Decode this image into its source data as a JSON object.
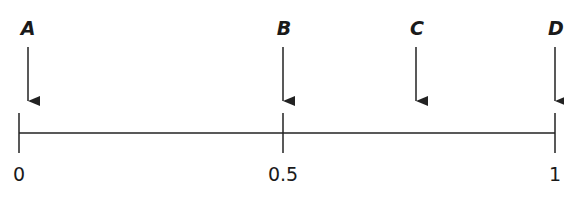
{
  "diagram": {
    "type": "number-line",
    "line_color": "#222222",
    "axis": {
      "min": 0,
      "max": 1
    },
    "ticks": [
      {
        "value": 0,
        "label": "0",
        "x": 19
      },
      {
        "value": 0.5,
        "label": "0.5",
        "x": 283
      },
      {
        "value": 1,
        "label": "1",
        "x": 555
      }
    ],
    "points": [
      {
        "label": "A",
        "x": 28,
        "approx_value": 0
      },
      {
        "label": "B",
        "x": 283,
        "approx_value": 0.5
      },
      {
        "label": "C",
        "x": 416,
        "approx_value": 0.75
      },
      {
        "label": "D",
        "x": 555,
        "approx_value": 1
      }
    ]
  }
}
